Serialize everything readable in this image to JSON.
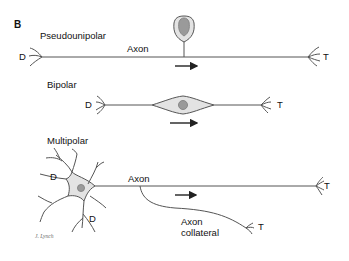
{
  "figure": {
    "panel_letter": "B",
    "colors": {
      "line": "#555555",
      "cell_fill": "#e3e3e3",
      "nucleus": "#9a9a9a",
      "text": "#111111",
      "arrow": "#222222"
    }
  },
  "pseudounipolar": {
    "title": "Pseudounipolar",
    "dendrite_label": "D",
    "axon_label": "Axon",
    "terminal_label": "T"
  },
  "bipolar": {
    "title": "Bipolar",
    "dendrite_label": "D",
    "terminal_label": "T"
  },
  "multipolar": {
    "title": "Multipolar",
    "dendrite_label_1": "D",
    "dendrite_label_2": "D",
    "axon_label": "Axon",
    "terminal_label": "T",
    "collateral_label_line1": "Axon",
    "collateral_label_line2": "collateral",
    "collateral_terminal_label": "T"
  },
  "signature": "J. Lynch"
}
